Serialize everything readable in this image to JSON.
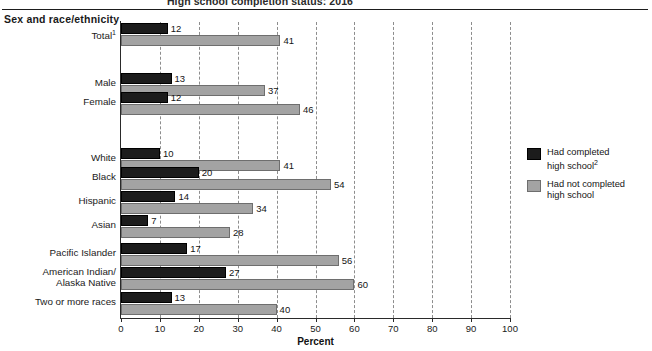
{
  "chart_data": {
    "type": "bar",
    "orientation": "horizontal",
    "title": "High school completion status: 2016",
    "group_heading": "Sex and race/ethnicity",
    "xlabel": "Percent",
    "ylabel": "",
    "xlim": [
      0,
      100
    ],
    "xticks": [
      0,
      10,
      20,
      30,
      40,
      50,
      60,
      70,
      80,
      90,
      100
    ],
    "grid": "vertical-dashed",
    "legend_position": "right",
    "categories": [
      "Total¹",
      "Male",
      "Female",
      "White",
      "Black",
      "Hispanic",
      "Asian",
      "Pacific Islander",
      "American Indian/ Alaska Native",
      "Two or more races"
    ],
    "series": [
      {
        "name": "Had completed high school²",
        "color": "#1c1c1c",
        "values": [
          12,
          13,
          12,
          10,
          20,
          14,
          7,
          17,
          27,
          13
        ]
      },
      {
        "name": "Had not completed high school",
        "color": "#a3a3a3",
        "values": [
          41,
          37,
          46,
          41,
          54,
          34,
          28,
          56,
          60,
          40
        ]
      }
    ]
  },
  "axis": {
    "xlabel": "Percent",
    "ticks": [
      "0",
      "10",
      "20",
      "30",
      "40",
      "50",
      "60",
      "70",
      "80",
      "90",
      "100"
    ]
  },
  "header": {
    "title": "High school completion status: 2016",
    "group_heading": "Sex and race/ethnicity"
  },
  "legend": {
    "items": [
      {
        "label_line1": "Had completed",
        "label_line2": "high school",
        "footnote": "2",
        "swatch": "completed"
      },
      {
        "label_line1": "Had not completed",
        "label_line2": "high school",
        "footnote": "",
        "swatch": "notcompleted"
      }
    ]
  },
  "rows": [
    {
      "label_line1": "Total",
      "label_line2": "",
      "footnote": "1",
      "completed": 12,
      "not_completed": 41
    },
    {
      "label_line1": "Male",
      "label_line2": "",
      "footnote": "",
      "completed": 13,
      "not_completed": 37
    },
    {
      "label_line1": "Female",
      "label_line2": "",
      "footnote": "",
      "completed": 12,
      "not_completed": 46
    },
    {
      "label_line1": "White",
      "label_line2": "",
      "footnote": "",
      "completed": 10,
      "not_completed": 41
    },
    {
      "label_line1": "Black",
      "label_line2": "",
      "footnote": "",
      "completed": 20,
      "not_completed": 54
    },
    {
      "label_line1": "Hispanic",
      "label_line2": "",
      "footnote": "",
      "completed": 14,
      "not_completed": 34
    },
    {
      "label_line1": "Asian",
      "label_line2": "",
      "footnote": "",
      "completed": 7,
      "not_completed": 28
    },
    {
      "label_line1": "Pacific Islander",
      "label_line2": "",
      "footnote": "",
      "completed": 17,
      "not_completed": 56
    },
    {
      "label_line1": "American Indian/",
      "label_line2": "Alaska Native",
      "footnote": "",
      "completed": 27,
      "not_completed": 60
    },
    {
      "label_line1": "Two or more races",
      "label_line2": "",
      "footnote": "",
      "completed": 13,
      "not_completed": 40
    }
  ]
}
